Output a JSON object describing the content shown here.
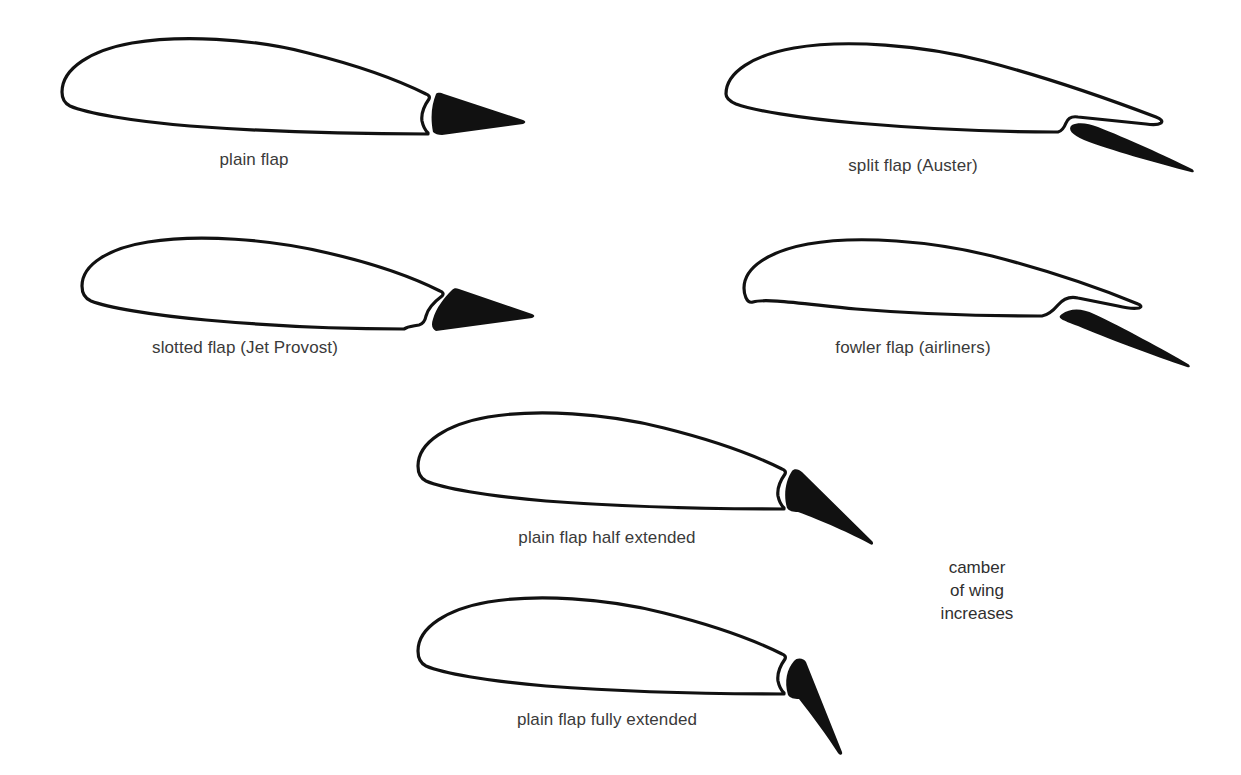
{
  "page": {
    "background_color": "#ffffff",
    "outline_color": "#111111",
    "flap_fill_color": "#111111",
    "caption_color": "#3a3a3a",
    "width": 1241,
    "height": 775
  },
  "figures": [
    {
      "id": "plain-flap",
      "caption": "plain flap",
      "flap_type": "plain",
      "deflection": "undeflected",
      "row": 1,
      "column": 1
    },
    {
      "id": "split-flap",
      "caption": "split flap (Auster)",
      "flap_type": "split",
      "aircraft": "Auster",
      "deflection": "deflected",
      "row": 1,
      "column": 2
    },
    {
      "id": "slotted-flap",
      "caption": "slotted flap (Jet Provost)",
      "flap_type": "slotted",
      "aircraft": "Jet Provost",
      "deflection": "deflected",
      "row": 2,
      "column": 1
    },
    {
      "id": "fowler-flap",
      "caption": "fowler flap (airliners)",
      "flap_type": "fowler",
      "aircraft": "airliners",
      "deflection": "deflected and extended aft",
      "row": 2,
      "column": 2
    },
    {
      "id": "plain-flap-half",
      "caption": "plain flap half extended",
      "flap_type": "plain",
      "deflection": "half extended",
      "row": 3,
      "column": 1
    },
    {
      "id": "plain-flap-full",
      "caption": "plain flap fully extended",
      "flap_type": "plain",
      "deflection": "fully extended",
      "row": 4,
      "column": 1
    }
  ],
  "annotation": {
    "line1": "camber",
    "line2": "of wing",
    "line3": "increases"
  }
}
